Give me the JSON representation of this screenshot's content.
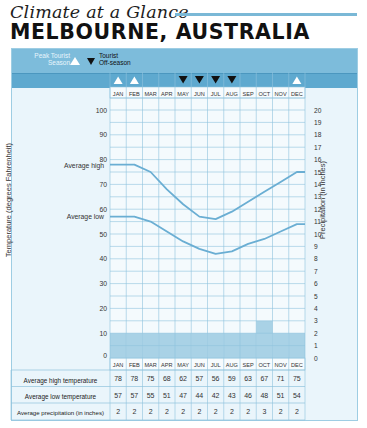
{
  "header": {
    "kicker": "Climate at a Glance",
    "title": "MELBOURNE, AUSTRALIA"
  },
  "legend": {
    "peak_label": "Peak Tourist Season",
    "peak_label_line1": "Peak Tourist",
    "peak_label_line2": "Season",
    "offseason_label_line1": "Tourist",
    "offseason_label_line2": "Off-season",
    "peak_icon": "triangle-up-icon",
    "offseason_icon": "triangle-down-icon"
  },
  "colors": {
    "panel_bg": "#eaf5fb",
    "band": "#7dbcdb",
    "band_dark": "#5ea9cf",
    "grid": "#8fc3dd",
    "line": "#6aaed3",
    "bar": "#a9d2e6",
    "kicker_rule": "#7ab8d6"
  },
  "chart_data": {
    "type": "line",
    "categories": [
      "JAN",
      "FEB",
      "MAR",
      "APR",
      "MAY",
      "JUN",
      "JUL",
      "AUG",
      "SEP",
      "OCT",
      "NOV",
      "DEC"
    ],
    "series": [
      {
        "name": "Average high",
        "type": "line",
        "axis": "left",
        "values": [
          78,
          78,
          75,
          68,
          62,
          57,
          56,
          59,
          63,
          67,
          71,
          75
        ]
      },
      {
        "name": "Average low",
        "type": "line",
        "axis": "left",
        "values": [
          57,
          57,
          55,
          51,
          47,
          44,
          42,
          43,
          46,
          48,
          51,
          54
        ]
      },
      {
        "name": "Average precipitation (in inches)",
        "type": "bar",
        "axis": "right",
        "values": [
          2,
          2,
          2,
          2,
          2,
          2,
          2,
          2,
          2,
          3,
          2,
          2
        ]
      }
    ],
    "tourist_season": [
      "peak",
      "peak",
      "none",
      "none",
      "off",
      "off",
      "off",
      "off",
      "none",
      "none",
      "none",
      "peak"
    ],
    "ylabel": "Temperature (degrees Fahrenheit)",
    "ylabel_right": "Precipitation (in inches)",
    "ylim": [
      0,
      100
    ],
    "ylim_right": [
      0,
      20
    ],
    "yticks": [
      0,
      10,
      20,
      30,
      40,
      50,
      60,
      70,
      80,
      90,
      100
    ],
    "yticks_right": [
      0,
      1,
      2,
      3,
      4,
      5,
      6,
      7,
      8,
      9,
      10,
      11,
      12,
      13,
      14,
      15,
      16,
      17,
      18,
      19,
      20
    ],
    "grid": true
  },
  "table": {
    "months": [
      "JAN",
      "FEB",
      "MAR",
      "APR",
      "MAY",
      "JUN",
      "JUL",
      "AUG",
      "SEP",
      "OCT",
      "NOV",
      "DEC"
    ],
    "rows": [
      {
        "label": "Average high temperature",
        "values": [
          "78",
          "78",
          "75",
          "68",
          "62",
          "57",
          "56",
          "59",
          "63",
          "67",
          "71",
          "75"
        ]
      },
      {
        "label": "Average low temperature",
        "values": [
          "57",
          "57",
          "55",
          "51",
          "47",
          "44",
          "42",
          "43",
          "46",
          "48",
          "51",
          "54"
        ]
      },
      {
        "label": "Average precipitation (in inches)",
        "values": [
          "2",
          "2",
          "2",
          "2",
          "2",
          "2",
          "2",
          "2",
          "2",
          "3",
          "2",
          "2"
        ]
      }
    ]
  }
}
